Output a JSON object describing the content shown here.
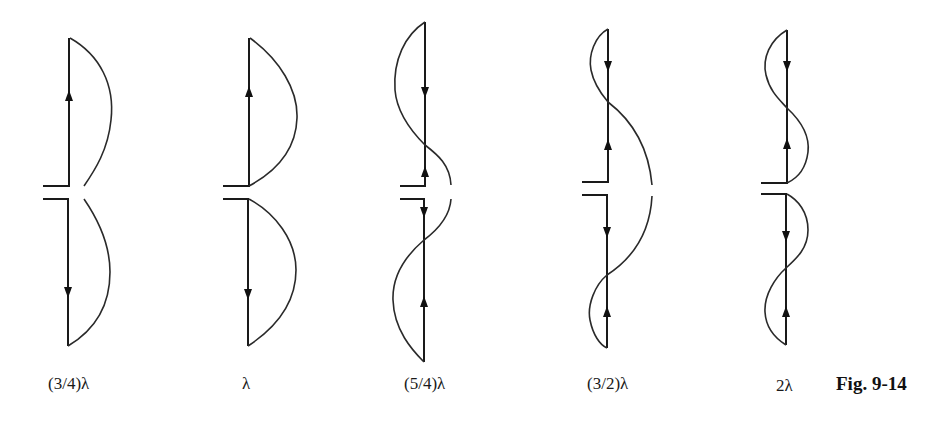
{
  "figure": {
    "caption": "Fig. 9-14",
    "colors": {
      "line": "#1a1a1a",
      "background": "#ffffff"
    }
  },
  "antennas": [
    {
      "label": "(3/4)λ",
      "length_wavelengths": 0.75
    },
    {
      "label": "λ",
      "length_wavelengths": 1.0
    },
    {
      "label": "(5/4)λ",
      "length_wavelengths": 1.25
    },
    {
      "label": "(3/2)λ",
      "length_wavelengths": 1.5
    },
    {
      "label": "2λ",
      "length_wavelengths": 2.0
    }
  ]
}
